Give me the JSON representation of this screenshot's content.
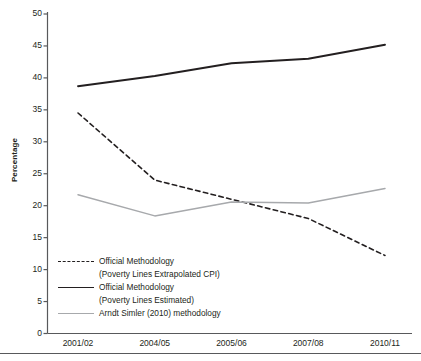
{
  "chart_data": {
    "type": "line",
    "title": "",
    "xlabel": "",
    "ylabel": "Percentage",
    "categories": [
      "2001/02",
      "2004/05",
      "2005/06",
      "2007/08",
      "2010/11"
    ],
    "ylim": [
      0,
      50
    ],
    "yticks": [
      0,
      5,
      10,
      15,
      20,
      25,
      30,
      35,
      40,
      45,
      50
    ],
    "grid": false,
    "legend_position": "inside-bottom-left",
    "series": [
      {
        "name": "Official Methodology (Poverty Lines Extrapolated CPI)",
        "style": "dashed",
        "color": "#231f20",
        "values": [
          34.5,
          24.0,
          21.0,
          18.0,
          12.2
        ]
      },
      {
        "name": "Official Methodology (Poverty Lines Estimated)",
        "style": "solid",
        "color": "#231f20",
        "values": [
          38.7,
          40.3,
          42.3,
          43.0,
          45.2
        ]
      },
      {
        "name": "Arndt Simler (2010) methodology",
        "style": "solid-gray",
        "color": "#a7a9ac",
        "values": [
          21.7,
          18.4,
          20.6,
          20.4,
          22.7
        ]
      }
    ]
  },
  "axis": {
    "y_title": "Percentage",
    "y_tick_labels": [
      "50",
      "45",
      "40",
      "35",
      "30",
      "25",
      "20",
      "15",
      "10",
      "5",
      "0"
    ],
    "x_tick_labels": [
      "2001/02",
      "2004/05",
      "2005/06",
      "2007/08",
      "2010/11"
    ]
  },
  "legend": {
    "items": [
      {
        "line1": "Official Methodology",
        "line2": "(Poverty Lines Extrapolated CPI)",
        "swatch": "dashed-line-swatch"
      },
      {
        "line1": "Official Methodology",
        "line2": "(Poverty Lines Estimated)",
        "swatch": "solid-line-swatch"
      },
      {
        "line1": "Arndt Simler (2010) methodology",
        "line2": "",
        "swatch": "gray-line-swatch"
      }
    ]
  },
  "colors": {
    "axis": "#58595b",
    "series_dark": "#231f20",
    "series_gray": "#a7a9ac",
    "background": "#ffffff"
  }
}
